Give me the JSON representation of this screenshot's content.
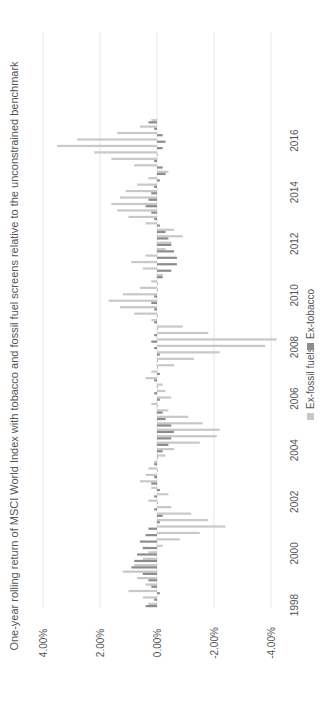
{
  "chart_data": {
    "type": "bar",
    "orientation": "rotated-90-ccw",
    "title": "One-year rolling return of MSCI World Index with tobacco and fossil fuel screens relative to the unconstrained benchmark",
    "xlabel": "",
    "ylabel": "",
    "ylim": [
      -4,
      4
    ],
    "y_ticks": [
      "4.00%",
      "2.00%",
      "0.00%",
      "-2.00%",
      "-4.00%"
    ],
    "y_tick_values": [
      4,
      2,
      0,
      -2,
      -4
    ],
    "x_ticks": [
      "1998",
      "2000",
      "2002",
      "2004",
      "2006",
      "2008",
      "2010",
      "2012",
      "2014",
      "2016"
    ],
    "x_tick_values": [
      1998,
      2000,
      2002,
      2004,
      2006,
      2008,
      2010,
      2012,
      2014,
      2016
    ],
    "xlim": [
      1997.6,
      2017.2
    ],
    "grid": true,
    "legend_position": "bottom",
    "series": [
      {
        "name": "Ex-fossil fuels",
        "color": "#c8c8c8",
        "x": [
          1998.0,
          1998.25,
          1998.5,
          1998.75,
          1999.0,
          1999.25,
          1999.5,
          1999.75,
          2000.0,
          2000.25,
          2000.5,
          2000.75,
          2001.0,
          2001.25,
          2001.5,
          2001.75,
          2002.0,
          2002.25,
          2002.5,
          2002.75,
          2003.0,
          2003.25,
          2003.5,
          2003.75,
          2004.0,
          2004.25,
          2004.5,
          2004.75,
          2005.0,
          2005.25,
          2005.5,
          2005.75,
          2006.0,
          2006.25,
          2006.5,
          2006.75,
          2007.0,
          2007.25,
          2007.5,
          2007.75,
          2008.0,
          2008.25,
          2008.5,
          2008.75,
          2009.0,
          2009.25,
          2009.5,
          2009.75,
          2010.0,
          2010.25,
          2010.5,
          2010.75,
          2011.0,
          2011.25,
          2011.5,
          2011.75,
          2012.0,
          2012.25,
          2012.5,
          2012.75,
          2013.0,
          2013.25,
          2013.5,
          2013.75,
          2014.0,
          2014.25,
          2014.5,
          2014.75,
          2015.0,
          2015.25,
          2015.5,
          2015.75,
          2016.0,
          2016.25,
          2016.5,
          2016.75
        ],
        "values": [
          0.3,
          0.5,
          1.0,
          0.4,
          0.7,
          1.2,
          0.8,
          0.5,
          0.3,
          -0.2,
          -0.8,
          -1.5,
          -2.4,
          -1.8,
          -1.2,
          -0.5,
          0.3,
          -0.4,
          0.2,
          0.6,
          0.4,
          0.3,
          0.1,
          -0.3,
          -0.6,
          -1.5,
          -2.1,
          -2.2,
          -1.6,
          -1.1,
          -0.4,
          0.2,
          -0.5,
          -0.3,
          -0.2,
          0.4,
          0.2,
          -0.6,
          -1.3,
          -2.2,
          -3.8,
          -4.2,
          -1.8,
          -0.9,
          0.2,
          0.8,
          1.3,
          1.7,
          1.2,
          0.6,
          0.2,
          -0.2,
          0.5,
          0.9,
          0.4,
          -0.3,
          -0.5,
          -0.9,
          -0.6,
          0.4,
          1.0,
          1.4,
          1.6,
          1.3,
          1.1,
          0.7,
          0.3,
          -0.4,
          0.8,
          1.6,
          2.2,
          3.5,
          2.8,
          1.4,
          0.6,
          0.2
        ],
        "values_note": "estimated from gridlines; positive values extend toward 4.00%"
      },
      {
        "name": "Ex-tobacco",
        "color": "#8c8c8c",
        "x": [
          1998.0,
          1998.25,
          1998.5,
          1998.75,
          1999.0,
          1999.25,
          1999.5,
          1999.75,
          2000.0,
          2000.25,
          2000.5,
          2000.75,
          2001.0,
          2001.25,
          2001.5,
          2001.75,
          2002.0,
          2002.25,
          2002.5,
          2002.75,
          2003.0,
          2003.25,
          2003.5,
          2003.75,
          2004.0,
          2004.25,
          2004.5,
          2004.75,
          2005.0,
          2005.25,
          2005.5,
          2005.75,
          2006.0,
          2006.25,
          2006.5,
          2006.75,
          2007.0,
          2007.25,
          2007.5,
          2007.75,
          2008.0,
          2008.25,
          2008.5,
          2008.75,
          2009.0,
          2009.25,
          2009.5,
          2009.75,
          2010.0,
          2010.25,
          2010.5,
          2010.75,
          2011.0,
          2011.25,
          2011.5,
          2011.75,
          2012.0,
          2012.25,
          2012.5,
          2012.75,
          2013.0,
          2013.25,
          2013.5,
          2013.75,
          2014.0,
          2014.25,
          2014.5,
          2014.75,
          2015.0,
          2015.25,
          2015.5,
          2015.75,
          2016.0,
          2016.25,
          2016.5,
          2016.75
        ],
        "values": [
          0.4,
          0.1,
          -0.1,
          0.2,
          0.3,
          0.5,
          0.9,
          0.8,
          0.7,
          0.5,
          0.6,
          0.4,
          0.3,
          -0.1,
          -0.2,
          0.1,
          0.0,
          0.1,
          -0.1,
          0.2,
          0.1,
          0.0,
          0.1,
          0.0,
          -0.2,
          -0.4,
          -0.5,
          -0.6,
          -0.5,
          -0.3,
          -0.2,
          0.0,
          -0.1,
          0.1,
          0.0,
          0.1,
          -0.1,
          0.0,
          0.0,
          -0.1,
          0.1,
          0.2,
          0.1,
          0.0,
          0.1,
          0.0,
          0.1,
          0.2,
          0.1,
          0.0,
          0.0,
          -0.2,
          -0.5,
          -0.7,
          -0.7,
          -0.6,
          -0.5,
          -0.4,
          -0.3,
          -0.1,
          0.1,
          0.2,
          0.4,
          0.3,
          0.2,
          0.1,
          -0.1,
          -0.3,
          -0.2,
          0.1,
          0.0,
          -0.2,
          -0.3,
          -0.2,
          0.1,
          0.3
        ],
        "values_note": "estimated from gridlines"
      }
    ]
  }
}
